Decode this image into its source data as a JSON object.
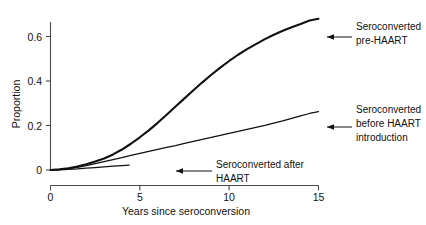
{
  "chart_data": {
    "type": "line",
    "title": "",
    "xlabel": "Years since seroconversion",
    "ylabel": "Proportion",
    "xlim": [
      0,
      15.6
    ],
    "ylim": [
      0,
      0.73
    ],
    "xticks": [
      0,
      5,
      10,
      15
    ],
    "xtick_labels": [
      "0",
      "5",
      "10",
      "15"
    ],
    "yticks": [
      0,
      0.2,
      0.4,
      0.6
    ],
    "ytick_labels": [
      "0",
      "0.2",
      "0.4",
      "0.6"
    ],
    "grid": false,
    "legend_position": "annotations-right",
    "series": [
      {
        "name": "Seroconverted pre-HAART",
        "style": "thick",
        "x": [
          0,
          0.5,
          1.0,
          1.5,
          2.0,
          2.5,
          3.0,
          3.5,
          4.0,
          4.5,
          5.0,
          5.5,
          6.0,
          6.5,
          7.0,
          7.5,
          8.0,
          8.5,
          9.0,
          9.5,
          10.0,
          10.5,
          11.0,
          11.5,
          12.0,
          12.5,
          13.0,
          13.5,
          14.0,
          14.5,
          15.0
        ],
        "y": [
          0.0,
          0.003,
          0.008,
          0.016,
          0.026,
          0.038,
          0.052,
          0.07,
          0.092,
          0.118,
          0.147,
          0.178,
          0.212,
          0.248,
          0.285,
          0.322,
          0.358,
          0.394,
          0.428,
          0.46,
          0.49,
          0.518,
          0.543,
          0.566,
          0.588,
          0.608,
          0.626,
          0.642,
          0.656,
          0.672,
          0.68
        ]
      },
      {
        "name": "Seroconverted before HAART introduction",
        "style": "thin",
        "x": [
          0,
          0.5,
          1.0,
          1.5,
          2.0,
          2.5,
          3.0,
          3.5,
          4.0,
          4.5,
          5.0,
          5.5,
          6.0,
          6.5,
          7.0,
          7.5,
          8.0,
          8.5,
          9.0,
          9.5,
          10.0,
          10.5,
          11.0,
          11.5,
          12.0,
          12.5,
          13.0,
          13.5,
          14.0,
          14.5,
          15.0
        ],
        "y": [
          0.0,
          0.002,
          0.006,
          0.012,
          0.02,
          0.029,
          0.038,
          0.047,
          0.056,
          0.066,
          0.075,
          0.084,
          0.093,
          0.102,
          0.11,
          0.12,
          0.129,
          0.138,
          0.147,
          0.156,
          0.165,
          0.174,
          0.183,
          0.192,
          0.201,
          0.211,
          0.221,
          0.232,
          0.243,
          0.254,
          0.262
        ]
      },
      {
        "name": "Seroconverted after HAART",
        "style": "thin",
        "x": [
          0,
          0.5,
          1.0,
          1.5,
          2.0,
          2.5,
          3.0,
          3.5,
          4.0,
          4.4
        ],
        "y": [
          0.0,
          0.001,
          0.003,
          0.005,
          0.008,
          0.011,
          0.014,
          0.017,
          0.02,
          0.022
        ]
      }
    ],
    "annotations": [
      {
        "name": "annotation-pre-haart",
        "lines": [
          "Seroconverted",
          "pre-HAART"
        ],
        "points_to_x": 15.0,
        "points_to_y": 0.68
      },
      {
        "name": "annotation-before-haart-introduction",
        "lines": [
          "Seroconverted",
          "before HAART",
          "introduction"
        ],
        "points_to_x": 15.0,
        "points_to_y": 0.262
      },
      {
        "name": "annotation-after-haart",
        "lines": [
          "Seroconverted after",
          "HAART"
        ],
        "points_to_x": 4.4,
        "points_to_y": 0.022
      }
    ]
  }
}
